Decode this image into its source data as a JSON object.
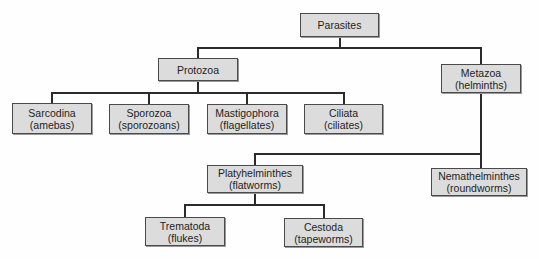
{
  "diagram": {
    "title": "Parasites",
    "root": {
      "label": "Parasites"
    },
    "protozoa": {
      "label": "Protozoa",
      "children": [
        {
          "name": "Sarcodina",
          "common": "(amebas)"
        },
        {
          "name": "Sporozoa",
          "common": "(sporozoans)"
        },
        {
          "name": "Mastigophora",
          "common": "(flagellates)"
        },
        {
          "name": "Ciliata",
          "common": "(ciliates)"
        }
      ]
    },
    "metazoa": {
      "name": "Metazoa",
      "common": "(helminths)",
      "children": [
        {
          "name": "Platyhelminthes",
          "common": "(flatworms)",
          "children": [
            {
              "name": "Trematoda",
              "common": "(flukes)"
            },
            {
              "name": "Cestoda",
              "common": "(tapeworms)"
            }
          ]
        },
        {
          "name": "Nemathelminthes",
          "common": "(roundworms)"
        }
      ]
    }
  }
}
